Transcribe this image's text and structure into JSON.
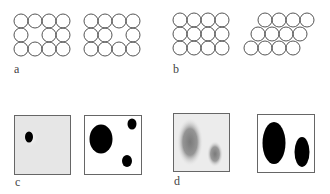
{
  "figure": {
    "panels": [
      {
        "id": "a",
        "label": "a",
        "description": "4x3 circle arrays with vacancy defects"
      },
      {
        "id": "b",
        "label": "b",
        "description": "square lattice vs sheared/offset lattice"
      },
      {
        "id": "c",
        "label": "c",
        "description": "grayscale image and binary segmentation"
      },
      {
        "id": "d",
        "label": "d",
        "description": "blurred blobs and thresholded ellipses"
      }
    ],
    "colors": {
      "stroke": "#555555",
      "fill_dark": "#000000",
      "bg_gray": "#e6e6e6"
    }
  }
}
